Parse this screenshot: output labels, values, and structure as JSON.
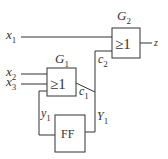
{
  "diagram": {
    "type": "logic-circuit",
    "inputs": {
      "x1": {
        "base": "x",
        "sub": "1"
      },
      "x2": {
        "base": "x",
        "sub": "2"
      },
      "x3": {
        "base": "x",
        "sub": "3"
      }
    },
    "gates": {
      "g1": {
        "label_base": "G",
        "label_sub": "1",
        "symbol": "≥1"
      },
      "g2": {
        "label_base": "G",
        "label_sub": "2",
        "symbol": "≥1"
      }
    },
    "flipflop": {
      "label": "FF"
    },
    "signals": {
      "c1": {
        "base": "c",
        "sub": "1"
      },
      "c2": {
        "base": "c",
        "sub": "2"
      },
      "y1": {
        "base": "y",
        "sub": "1"
      },
      "Y1": {
        "base": "Y",
        "sub": "1"
      },
      "z": {
        "base": "z"
      }
    }
  }
}
